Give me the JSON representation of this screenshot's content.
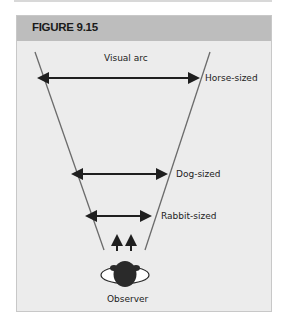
{
  "figure": {
    "title": "FIGURE 9.15"
  },
  "diagram": {
    "arc_label": "Visual arc",
    "arrows": [
      {
        "label": "Horse-sized",
        "y": 78,
        "x1": 45,
        "x2": 200
      },
      {
        "label": "Dog-sized",
        "y": 174,
        "x1": 79,
        "x2": 168
      },
      {
        "label": "Rabbit-sized",
        "y": 216,
        "x1": 93,
        "x2": 152
      }
    ],
    "observer_label": "Observer",
    "colors": {
      "line": "#6b6b6b",
      "arrow": "#1f1f1f",
      "head": "#2a2a2a",
      "shoulders": "#ffffff",
      "background": "#ececec",
      "header": "#bdbdbd"
    }
  }
}
